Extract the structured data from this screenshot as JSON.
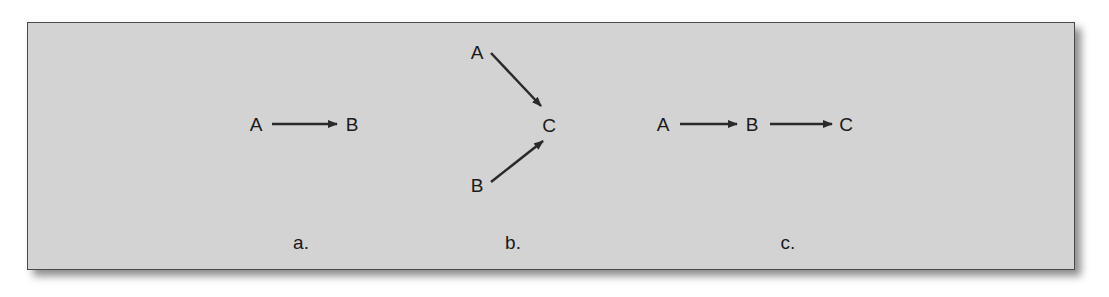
{
  "diagrams": [
    {
      "id": "a",
      "caption": "a.",
      "nodes": [
        {
          "label": "A",
          "x": 256,
          "y": 124
        },
        {
          "label": "B",
          "x": 352,
          "y": 124
        }
      ],
      "edges": [
        {
          "from": "A",
          "to": "B"
        }
      ]
    },
    {
      "id": "b",
      "caption": "b.",
      "nodes": [
        {
          "label": "A",
          "x": 477,
          "y": 52
        },
        {
          "label": "C",
          "x": 549,
          "y": 125
        },
        {
          "label": "B",
          "x": 477,
          "y": 185
        }
      ],
      "edges": [
        {
          "from": "A",
          "to": "C"
        },
        {
          "from": "B",
          "to": "C"
        }
      ]
    },
    {
      "id": "c",
      "caption": "c.",
      "nodes": [
        {
          "label": "A",
          "x": 663,
          "y": 124
        },
        {
          "label": "B",
          "x": 752,
          "y": 124
        },
        {
          "label": "C",
          "x": 846,
          "y": 124
        }
      ],
      "edges": [
        {
          "from": "A",
          "to": "B"
        },
        {
          "from": "B",
          "to": "C"
        }
      ]
    }
  ],
  "colors": {
    "panel": "#d3d3d3",
    "border": "#4a4a4a",
    "ink": "#1a1a1a"
  }
}
